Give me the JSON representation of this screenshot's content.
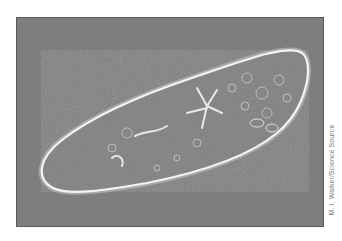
{
  "figure": {
    "credit": "M. I. Walker/Science Source",
    "background_color": "#7e7e7e",
    "cell_fill_color": "#8a8a8a",
    "membrane_color": "#f2f2f2"
  }
}
